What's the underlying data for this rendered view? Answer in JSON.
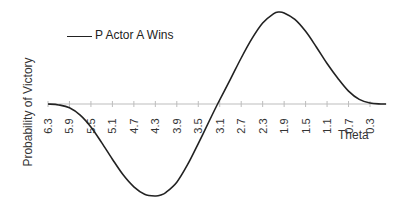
{
  "chart_data": {
    "type": "line",
    "title": "",
    "xlabel": "Theta",
    "ylabel": "Probability of Victory",
    "legend": [
      {
        "name": "P Actor A Wins",
        "color": "#222222"
      }
    ],
    "legend_position": "top-left",
    "grid": false,
    "x_axis_reversed": true,
    "x_tick_labels": [
      "6.3",
      "5.9",
      "5.5",
      "5.1",
      "4.7",
      "4.3",
      "3.9",
      "3.5",
      "3.1",
      "2.7",
      "2.3",
      "1.9",
      "1.5",
      "1.1",
      "0.7",
      "0.3"
    ],
    "xlim": [
      6.3,
      0.0
    ],
    "ylim": [
      -1.0,
      1.0
    ],
    "y_ticks_visible": false,
    "series": [
      {
        "name": "P Actor A Wins",
        "x": [
          6.3,
          6.1,
          5.9,
          5.7,
          5.5,
          5.3,
          5.1,
          4.9,
          4.7,
          4.5,
          4.3,
          4.2,
          4.1,
          3.9,
          3.7,
          3.5,
          3.3,
          3.14,
          2.9,
          2.7,
          2.5,
          2.3,
          2.1,
          2.0,
          1.9,
          1.7,
          1.5,
          1.3,
          1.1,
          0.9,
          0.7,
          0.5,
          0.3,
          0.1,
          0.0
        ],
        "values": [
          0.0,
          -0.01,
          -0.04,
          -0.12,
          -0.25,
          -0.42,
          -0.6,
          -0.77,
          -0.9,
          -0.98,
          -1.0,
          -0.99,
          -0.96,
          -0.85,
          -0.66,
          -0.43,
          -0.19,
          0.0,
          0.27,
          0.5,
          0.71,
          0.88,
          0.98,
          1.0,
          0.99,
          0.92,
          0.79,
          0.62,
          0.44,
          0.28,
          0.14,
          0.05,
          0.01,
          0.0,
          0.0
        ]
      }
    ]
  },
  "legend": {
    "label": "P Actor A Wins"
  },
  "axes": {
    "xlabel": "Theta",
    "ylabel": "Probability of Victory"
  }
}
